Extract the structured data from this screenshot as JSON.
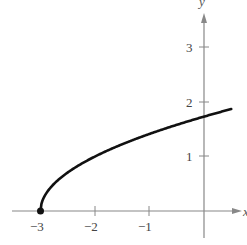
{
  "chart_data": {
    "type": "line",
    "title": "",
    "function": "y = sqrt(x + 3)",
    "xlabel": "x",
    "ylabel": "y",
    "xlim": [
      -3.6,
      0.6
    ],
    "ylim": [
      -0.5,
      3.8
    ],
    "grid": false,
    "legend": null,
    "x_ticks": [
      -3,
      -2,
      -1
    ],
    "x_tick_labels": [
      "−3",
      "−2",
      "−1"
    ],
    "y_ticks": [
      1,
      2,
      3
    ],
    "y_tick_labels": [
      "1",
      "2",
      "3"
    ],
    "series": [
      {
        "name": "y = sqrt(x+3)",
        "x": [
          -3,
          -2.75,
          -2.5,
          -2,
          -1.5,
          -1,
          -0.5,
          0,
          0.5
        ],
        "y": [
          0,
          0.5,
          0.707,
          1,
          1.225,
          1.414,
          1.581,
          1.732,
          1.871
        ]
      }
    ],
    "annotations": [
      {
        "type": "point",
        "x": -3,
        "y": 0,
        "style": "filled-dot"
      }
    ]
  },
  "labels": {
    "x_axis": "x",
    "y_axis": "y",
    "xt0": "−3",
    "xt1": "−2",
    "xt2": "−1",
    "yt0": "1",
    "yt1": "2",
    "yt2": "3"
  },
  "colors": {
    "curve": "#111111",
    "axes": "#777777",
    "labels": "#444444"
  }
}
